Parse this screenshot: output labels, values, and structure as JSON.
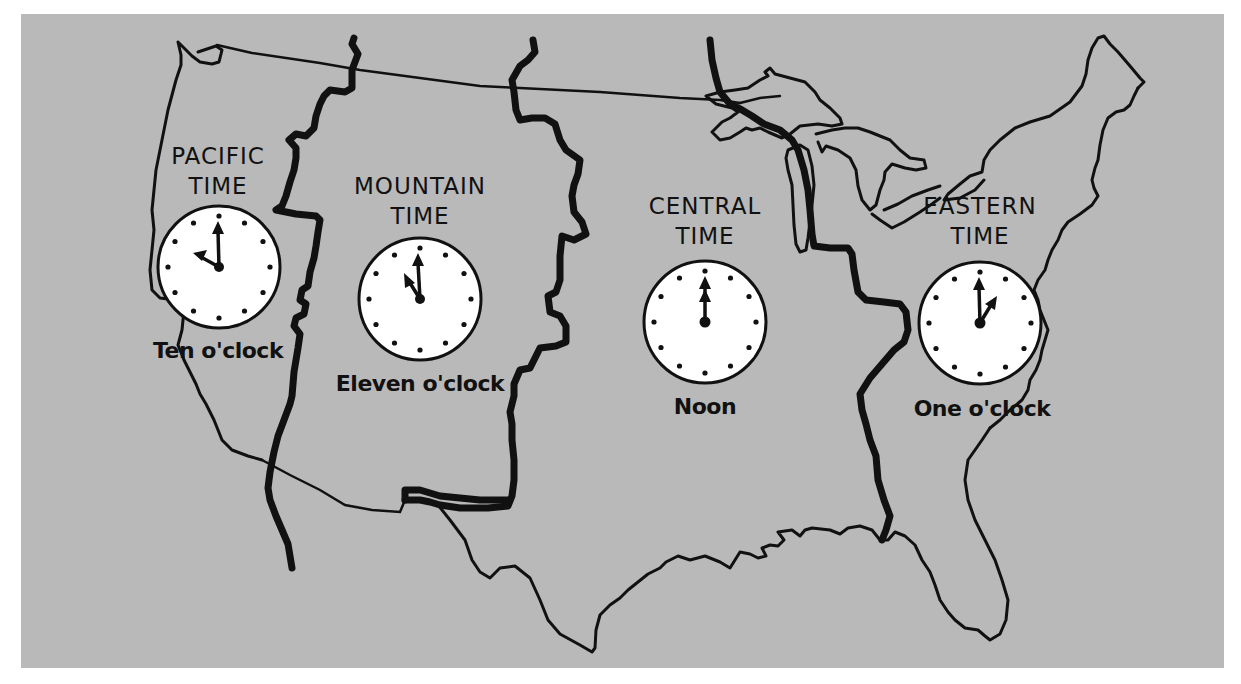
{
  "map": {
    "title": "United States Time Zones",
    "background_color": "#b9b9b9",
    "line_color": "#111111",
    "clock_face_color": "#ffffff"
  },
  "zones": [
    {
      "id": "pacific",
      "line1": "PACIFIC",
      "line2": "TIME",
      "time_label": "Ten o'clock",
      "hour": 10,
      "minute": 0
    },
    {
      "id": "mountain",
      "line1": "MOUNTAIN",
      "line2": "TIME",
      "time_label": "Eleven o'clock",
      "hour": 11,
      "minute": 0
    },
    {
      "id": "central",
      "line1": "CENTRAL",
      "line2": "TIME",
      "time_label": "Noon",
      "hour": 12,
      "minute": 0
    },
    {
      "id": "eastern",
      "line1": "EASTERN",
      "line2": "TIME",
      "time_label": "One o'clock",
      "hour": 1,
      "minute": 0
    }
  ]
}
